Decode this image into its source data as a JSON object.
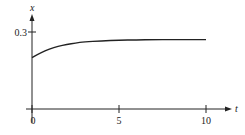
{
  "chart_data": {
    "type": "line",
    "title": "",
    "xlabel": "t",
    "ylabel": "x",
    "xlim": [
      0,
      11.5
    ],
    "ylim": [
      0,
      0.35
    ],
    "x_ticks": [
      0,
      5,
      10
    ],
    "x_tick_labels": [
      "0",
      "5",
      "10"
    ],
    "y_ticks": [
      0.3
    ],
    "y_tick_labels": [
      "0.3"
    ],
    "grid": false,
    "legend": null,
    "series": [
      {
        "name": "x(t)",
        "x": [
          0,
          0.5,
          1,
          1.5,
          2,
          2.5,
          3,
          4,
          5,
          6,
          7,
          8,
          9,
          10
        ],
        "y": [
          0.2,
          0.219,
          0.234,
          0.244,
          0.251,
          0.257,
          0.261,
          0.265,
          0.268,
          0.269,
          0.27,
          0.27,
          0.27,
          0.27
        ]
      }
    ]
  },
  "axes": {
    "x_label": "t",
    "y_label": "x",
    "x_tick_labels": [
      "0",
      "5",
      "10"
    ],
    "y_tick_label": "0.3"
  }
}
